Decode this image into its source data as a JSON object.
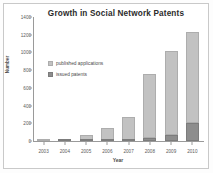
{
  "chart_data": {
    "type": "bar",
    "title": "Growth in Social Network Patents",
    "xlabel": "Year",
    "ylabel": "Number",
    "categories": [
      "2003",
      "2004",
      "2005",
      "2006",
      "2007",
      "2008",
      "2009",
      "2010"
    ],
    "series": [
      {
        "name": "published applications",
        "color": "#c2c2c2",
        "values": [
          3,
          10,
          68,
          145,
          260,
          730,
          955,
          1025
        ]
      },
      {
        "name": "issued patents",
        "color": "#8d8d8d",
        "values": [
          0,
          2,
          4,
          6,
          12,
          30,
          65,
          205
        ]
      }
    ],
    "totals": [
      3,
      12,
      72,
      151,
      272,
      760,
      1020,
      1230
    ],
    "stacked": true,
    "ylim": [
      0,
      1400
    ],
    "yticks": [
      0,
      200,
      400,
      600,
      800,
      1000,
      1200,
      1400
    ],
    "ytick_labels": [
      "0",
      "200",
      "400",
      "600",
      "800",
      "1000",
      "1200",
      "1400"
    ],
    "grid": false,
    "legend_position": "inside-upper-left"
  },
  "legend": {
    "entries": [
      {
        "label": "published applications"
      },
      {
        "label": "issued patents"
      }
    ]
  }
}
